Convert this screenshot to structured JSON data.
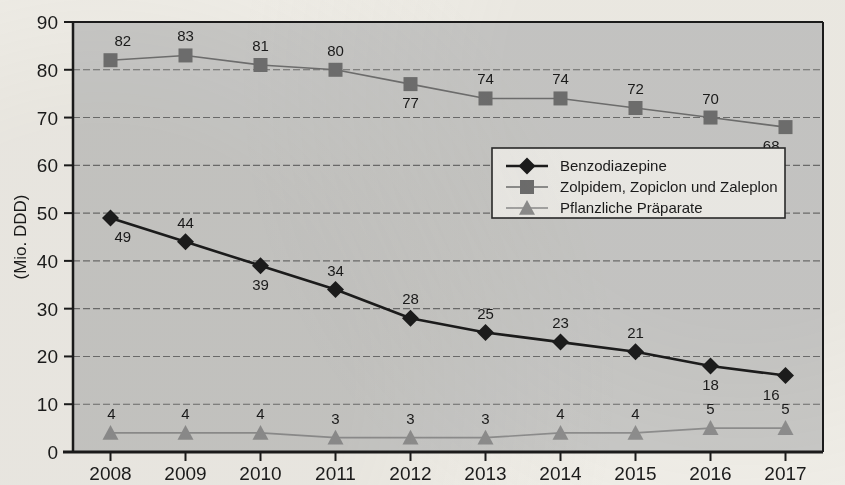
{
  "chart_data": {
    "type": "line",
    "title": "",
    "xlabel": "",
    "ylabel": "(Mio. DDD)",
    "categories": [
      "2008",
      "2009",
      "2010",
      "2011",
      "2012",
      "2013",
      "2014",
      "2015",
      "2016",
      "2017"
    ],
    "ylim": [
      0,
      90
    ],
    "yticks": [
      0,
      10,
      20,
      30,
      40,
      50,
      60,
      70,
      80,
      90
    ],
    "grid": true,
    "legend_position": "center-right",
    "series": [
      {
        "name": "Benzodiazepine",
        "marker": "diamond",
        "color": "#1c1c1c",
        "values": [
          49,
          44,
          39,
          34,
          28,
          25,
          23,
          21,
          18,
          16
        ],
        "label_positions": [
          "below",
          "above",
          "below",
          "above",
          "above",
          "above",
          "above",
          "above",
          "below",
          "below"
        ]
      },
      {
        "name": "Zolpidem, Zopiclon und Zaleplon",
        "marker": "square",
        "color": "#6f6f6f",
        "values": [
          82,
          83,
          81,
          80,
          77,
          74,
          74,
          72,
          70,
          68
        ],
        "label_positions": [
          "above",
          "above",
          "above",
          "above",
          "below",
          "above",
          "above",
          "above",
          "above",
          "below"
        ]
      },
      {
        "name": "Pflanzliche Präparate",
        "marker": "triangle",
        "color": "#8e8e8e",
        "values": [
          4,
          4,
          4,
          3,
          3,
          3,
          4,
          4,
          5,
          5
        ],
        "label_positions": [
          "above",
          "above",
          "above",
          "above",
          "above",
          "above",
          "above",
          "above",
          "above",
          "above"
        ]
      }
    ]
  },
  "colors": {
    "plot_background": "#c9c9c7",
    "page_background": "#f1efe9",
    "axis": "#1b1b1b",
    "gridline": "#6d6d6d",
    "legend_background": "#efeeea",
    "legend_border": "#2a2a2a",
    "series_1": "#1c1c1c",
    "series_2": "#6f6f6f",
    "series_3": "#8e8e8e"
  }
}
